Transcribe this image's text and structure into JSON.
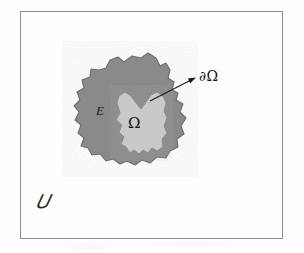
{
  "figure": {
    "type": "math-diagram",
    "frame": {
      "label": "𝑈",
      "label_name": "universe-set",
      "border_color": "#8e8e90",
      "fill_color": "#fefefe"
    },
    "regions": [
      {
        "name": "outer-region",
        "label": "E",
        "fill_color": "#8a8a8a",
        "stroke_color": "#6f6f6f"
      },
      {
        "name": "inner-region",
        "label": "Ω",
        "fill_color": "#c9c9c9",
        "stroke_color": "#8f8f8f"
      }
    ],
    "annotations": [
      {
        "name": "boundary-callout",
        "label": "∂Ω",
        "arrow_from": [
          150,
          101
        ],
        "arrow_to": [
          196,
          78
        ],
        "color": "#141414"
      }
    ],
    "page_background": "#fdfdfd"
  }
}
